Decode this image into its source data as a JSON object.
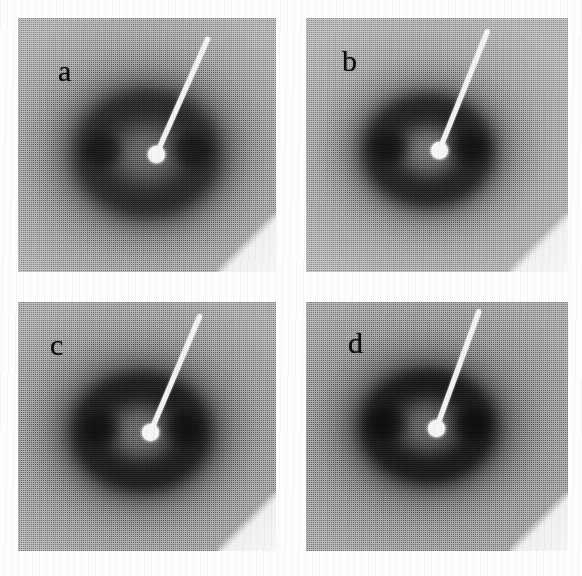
{
  "figure": {
    "type": "multi-panel-micrograph-figure",
    "background_color": "#fdfdfd",
    "columns": 2,
    "rows": 2,
    "panels": [
      {
        "id": "a",
        "label": "a",
        "label_x": 40,
        "label_y": 38,
        "x": 18,
        "y": 18,
        "width": 258,
        "height": 254,
        "film_tone": "#9b9b9b",
        "ring_color": "#2c2c2c",
        "core_color": "#4a4a4a",
        "ring_outer_radius_pct": 47,
        "ring_inner_radius_pct": 17,
        "center_x_pct": 50,
        "center_y_pct": 53,
        "beamstop_x": 130,
        "beamstop_y": 128,
        "beamstop_arm_angle_deg": 24,
        "beamstop_arm_length": 128,
        "lobe_offset_pct": 17,
        "lobe_color": "#1d1d1d",
        "corner_wedge": true
      },
      {
        "id": "b",
        "label": "b",
        "label_x": 36,
        "label_y": 28,
        "x": 306,
        "y": 18,
        "width": 262,
        "height": 254,
        "film_tone": "#9f9f9f",
        "ring_color": "#262626",
        "core_color": "#565656",
        "ring_outer_radius_pct": 44,
        "ring_inner_radius_pct": 15,
        "center_x_pct": 47,
        "center_y_pct": 52,
        "beamstop_x": 125,
        "beamstop_y": 124,
        "beamstop_arm_angle_deg": 22,
        "beamstop_arm_length": 130,
        "lobe_offset_pct": 15,
        "lobe_color": "#151515",
        "corner_wedge": true
      },
      {
        "id": "c",
        "label": "c",
        "label_x": 32,
        "label_y": 28,
        "x": 18,
        "y": 302,
        "width": 258,
        "height": 249,
        "film_tone": "#939393",
        "ring_color": "#202020",
        "core_color": "#4f4f4f",
        "ring_outer_radius_pct": 46,
        "ring_inner_radius_pct": 16,
        "center_x_pct": 48,
        "center_y_pct": 52,
        "beamstop_x": 124,
        "beamstop_y": 122,
        "beamstop_arm_angle_deg": 23,
        "beamstop_arm_length": 128,
        "lobe_offset_pct": 16,
        "lobe_color": "#121212",
        "corner_wedge": true
      },
      {
        "id": "d",
        "label": "d",
        "label_x": 42,
        "label_y": 26,
        "x": 306,
        "y": 302,
        "width": 262,
        "height": 249,
        "film_tone": "#8e8e8e",
        "ring_color": "#1c1c1c",
        "core_color": "#484848",
        "ring_outer_radius_pct": 45,
        "ring_inner_radius_pct": 16,
        "center_x_pct": 47,
        "center_y_pct": 50,
        "beamstop_x": 122,
        "beamstop_y": 118,
        "beamstop_arm_angle_deg": 20,
        "beamstop_arm_length": 126,
        "lobe_offset_pct": 16,
        "lobe_color": "#101010",
        "corner_wedge": true
      }
    ]
  }
}
